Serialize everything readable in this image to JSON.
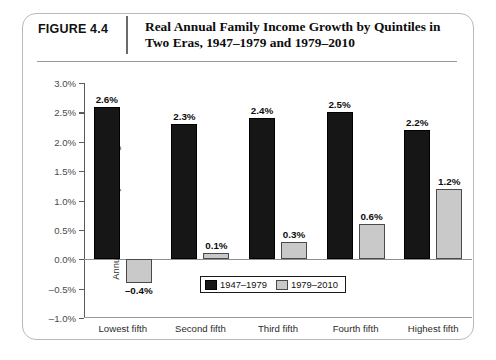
{
  "figure": {
    "number": "FIGURE 4.4",
    "title": "Real Annual Family Income Growth by Quintiles in Two Eras, 1947–1979 and 1979–2010"
  },
  "chart_data": {
    "type": "bar",
    "title": "Real Annual Family Income Growth by Quintiles in Two Eras, 1947–1979 and 1979–2010",
    "xlabel": "",
    "ylabel": "Annualized real family income growth",
    "categories": [
      "Lowest fifth",
      "Second fifth",
      "Third fifth",
      "Fourth fifth",
      "Highest fifth"
    ],
    "series": [
      {
        "name": "1947–1979",
        "color": "#161616",
        "values": [
          2.6,
          2.3,
          2.4,
          2.5,
          2.2
        ],
        "labels": [
          "2.6%",
          "2.3%",
          "2.4%",
          "2.5%",
          "2.2%"
        ]
      },
      {
        "name": "1979–2010",
        "color": "#c9c9c9",
        "values": [
          -0.4,
          0.1,
          0.3,
          0.6,
          1.2
        ],
        "labels": [
          "–0.4%",
          "0.1%",
          "0.3%",
          "0.6%",
          "1.2%"
        ]
      }
    ],
    "ylim": [
      -1.0,
      3.0
    ],
    "ytick_values": [
      3.0,
      2.5,
      2.0,
      1.5,
      1.0,
      0.5,
      0.0,
      -0.5,
      -1.0
    ],
    "ytick_labels": [
      "3.0%",
      "2.5%",
      "2.0%",
      "1.5%",
      "1.0%",
      "0.5%",
      "0.0%",
      "–0.5%",
      "–1.0%"
    ],
    "grid": false,
    "legend_position": "bottom-center"
  }
}
